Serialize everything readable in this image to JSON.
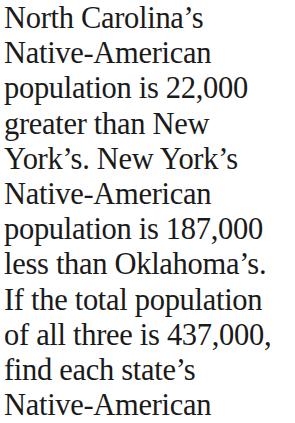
{
  "problem": {
    "lines": [
      "North Carolina’s",
      "Native-American",
      "population is 22,000",
      "greater than New",
      "York’s. New York’s",
      "Native-American",
      "population is 187,000",
      "less than Oklahoma’s.",
      "If the total population",
      "of all three is 437,000,",
      "find each state’s",
      "Native-American"
    ]
  }
}
